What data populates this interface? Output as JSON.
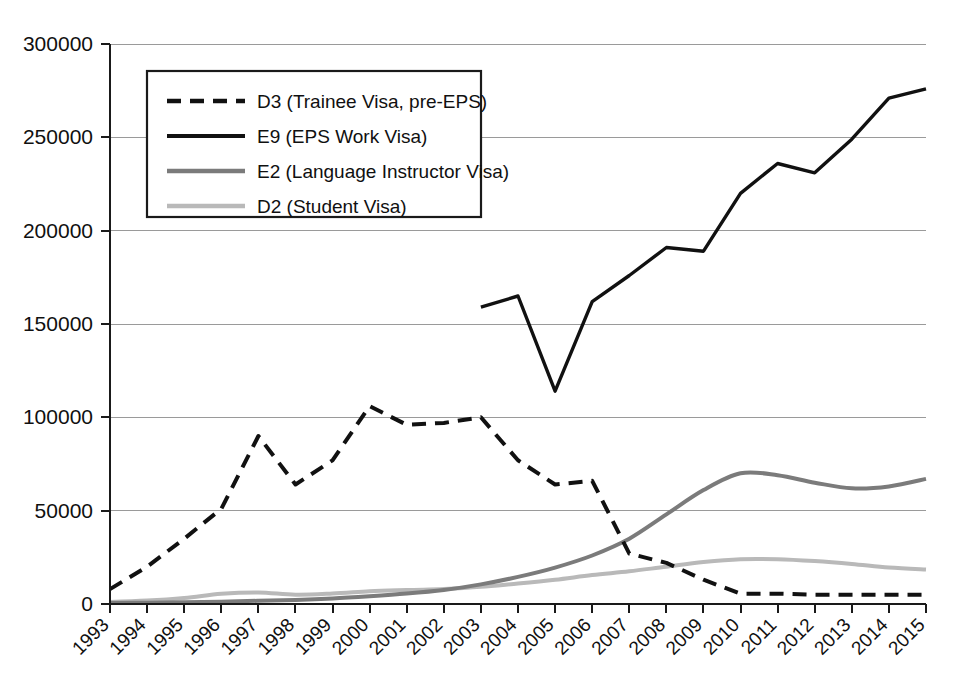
{
  "chart_data": {
    "type": "line",
    "title": "",
    "subtitle": "",
    "xlabel": "",
    "ylabel": "",
    "grid": true,
    "legend_position": "top-left",
    "xlim": [
      1993,
      2015
    ],
    "ylim": [
      0,
      300000
    ],
    "ytick_labels": [
      "0",
      "50000",
      "100000",
      "150000",
      "200000",
      "250000",
      "300000"
    ],
    "ytick_values": [
      0,
      50000,
      100000,
      150000,
      200000,
      250000,
      300000
    ],
    "categories": [
      "1993",
      "1994",
      "1995",
      "1996",
      "1997",
      "1998",
      "1999",
      "2000",
      "2001",
      "2002",
      "2003",
      "2004",
      "2005",
      "2006",
      "2007",
      "2008",
      "2009",
      "2010",
      "2011",
      "2012",
      "2013",
      "2014",
      "2015"
    ],
    "x": [
      1993,
      1994,
      1995,
      1996,
      1997,
      1998,
      1999,
      2000,
      2001,
      2002,
      2003,
      2004,
      2005,
      2006,
      2007,
      2008,
      2009,
      2010,
      2011,
      2012,
      2013,
      2014,
      2015
    ],
    "series": [
      {
        "name": "D3 (Trainee Visa, pre-EPS)",
        "short": "D3",
        "style": "dashed",
        "color": "#111111",
        "width": 4,
        "values": [
          8000,
          20000,
          35000,
          51000,
          90000,
          64000,
          77000,
          106000,
          96000,
          97000,
          100000,
          77000,
          64000,
          66000,
          27000,
          22000,
          13000,
          5500,
          5500,
          5000,
          5000,
          5000,
          5000
        ]
      },
      {
        "name": "E9 (EPS Work Visa)",
        "short": "E9",
        "style": "solid",
        "color": "#111111",
        "width": 3.4,
        "values": [
          null,
          null,
          null,
          null,
          null,
          null,
          null,
          null,
          null,
          null,
          159000,
          165000,
          114000,
          162000,
          176000,
          191000,
          189000,
          220000,
          236000,
          231000,
          249000,
          271000,
          276000
        ]
      },
      {
        "name": "E2 (Language Instructor Visa)",
        "short": "E2",
        "style": "solid",
        "color": "#7b7b7b",
        "width": 4,
        "values": [
          500,
          700,
          900,
          1200,
          1700,
          2200,
          3000,
          4200,
          5600,
          7500,
          10500,
          14500,
          19500,
          26000,
          35000,
          48000,
          61000,
          70000,
          69000,
          65000,
          62000,
          63000,
          67000
        ]
      },
      {
        "name": "D2 (Student Visa)",
        "short": "D2",
        "style": "solid",
        "color": "#b9b9b9",
        "width": 4,
        "values": [
          1000,
          1800,
          3200,
          5500,
          6200,
          5000,
          5600,
          6800,
          7500,
          8000,
          9200,
          11000,
          13000,
          15500,
          17500,
          20000,
          22500,
          24000,
          24000,
          23000,
          21500,
          19500,
          18500
        ]
      }
    ]
  },
  "axes": {
    "y_axis_name": "y-axis",
    "x_axis_name": "x-axis"
  },
  "legend": {
    "entries": [
      {
        "label": "D3 (Trainee Visa, pre-EPS)",
        "swatch": "dashed-black-line-swatch"
      },
      {
        "label": "E9 (EPS Work Visa)",
        "swatch": "solid-black-line-swatch"
      },
      {
        "label": "E2 (Language Instructor Visa)",
        "swatch": "solid-gray-line-swatch"
      },
      {
        "label": "D2 (Student Visa)",
        "swatch": "solid-lightgray-line-swatch"
      }
    ]
  },
  "colors": {
    "d3_series": "#111111",
    "e9_series": "#111111",
    "e2_series": "#7b7b7b",
    "d2_series": "#b9b9b9",
    "gridline": "#9a9a9a",
    "axis": "#1a1a1a",
    "background": "#ffffff"
  }
}
